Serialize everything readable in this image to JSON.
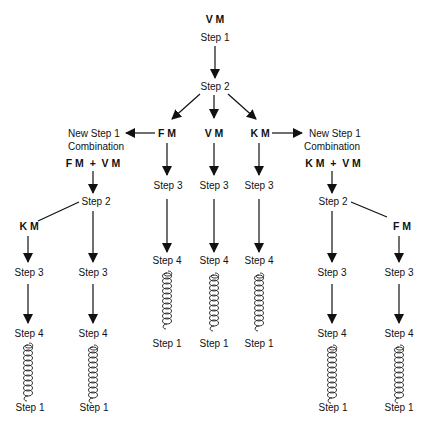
{
  "diagram": {
    "root": {
      "label": "V M",
      "step": "Step 1"
    },
    "center_step": "Step 2",
    "branches": {
      "fm": "F M",
      "vm": "V M",
      "km": "K M"
    },
    "left_combo": {
      "title_line1": "New Step 1",
      "title_line2": "Combination",
      "combo": "F M  +  V M",
      "step2": "Step 2",
      "side_label": "K M"
    },
    "right_combo": {
      "title_line1": "New Step 1",
      "title_line2": "Combination",
      "combo": "K M  +  V M",
      "step2": "Step 2",
      "side_label": "F M"
    },
    "step3": "Step 3",
    "step4": "Step 4",
    "step1": "Step 1",
    "coil_icon": "helix-coil-icon"
  }
}
